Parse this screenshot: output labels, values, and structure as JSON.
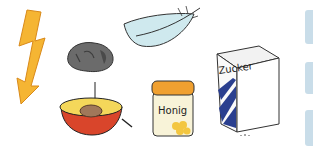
{
  "illustrations": {
    "lightning": {
      "name": "lightning"
    },
    "stone": {
      "name": "stone"
    },
    "feather": {
      "name": "feather"
    },
    "plum": {
      "name": "plum-half"
    },
    "honey": {
      "name": "honey-jar",
      "label": "Honig"
    },
    "sugar": {
      "name": "sugar-box",
      "label": "Zucker"
    }
  },
  "answer_boxes": [
    {
      "color": "#c9dde9"
    },
    {
      "color": "#c9dde9"
    },
    {
      "color": "#c9dde9"
    }
  ],
  "colors": {
    "lightning": "#f5b533",
    "stone": "#6b6b6b",
    "feather": "#cfe9ee",
    "plum_flesh": "#f4d75a",
    "plum_skin": "#d9452b",
    "pit": "#a0785a",
    "honey_lid": "#f0a030",
    "sugar_blue": "#2a3f8f"
  }
}
